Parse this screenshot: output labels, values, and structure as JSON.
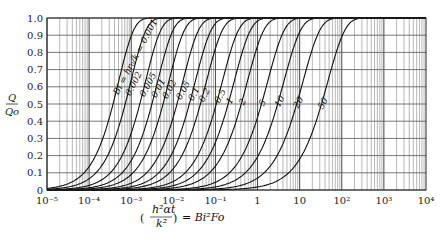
{
  "chart_data": {
    "type": "line",
    "title": "",
    "xlabel": "(h²αt / k²) = Bi²Fo",
    "ylabel": "Q / Qo",
    "xscale": "log",
    "xlim": [
      1e-05,
      10000.0
    ],
    "ylim": [
      0,
      1.0
    ],
    "grid": true,
    "legend": "inline curve labels",
    "curve_label_prefix": "Bi = hr₀/k = ",
    "x_tick_labels": [
      "10⁻⁵",
      "10⁻⁴",
      "10⁻³",
      "10⁻²",
      "10⁻¹",
      "1",
      "10",
      "10²",
      "10³",
      "10⁴"
    ],
    "y_tick_labels": [
      "0",
      "0.1",
      "0.2",
      "0.3",
      "0.4",
      "0.5",
      "0.6",
      "0.7",
      "0.8",
      "0.9",
      "1.0"
    ],
    "series": [
      {
        "name": "0.001",
        "x_at_half": 0.00037
      },
      {
        "name": "0.002",
        "x_at_half": 0.00072
      },
      {
        "name": "0.005",
        "x_at_half": 0.0016
      },
      {
        "name": "0.01",
        "x_at_half": 0.0031
      },
      {
        "name": "0.02",
        "x_at_half": 0.0057
      },
      {
        "name": "0.05",
        "x_at_half": 0.0122
      },
      {
        "name": "0.1",
        "x_at_half": 0.024
      },
      {
        "name": "0.2",
        "x_at_half": 0.044
      },
      {
        "name": "0.5",
        "x_at_half": 0.105
      },
      {
        "name": "1",
        "x_at_half": 0.2
      },
      {
        "name": "2",
        "x_at_half": 0.41
      },
      {
        "name": "5",
        "x_at_half": 1.24
      },
      {
        "name": "10",
        "x_at_half": 3.0
      },
      {
        "name": "20",
        "x_at_half": 8.5
      },
      {
        "name": "50",
        "x_at_half": 33.0
      }
    ]
  },
  "axis": {
    "y_label_top": "Q",
    "y_label_bottom": "Qo",
    "x_label": "(h²αt/k²) = Bi²Fo"
  }
}
